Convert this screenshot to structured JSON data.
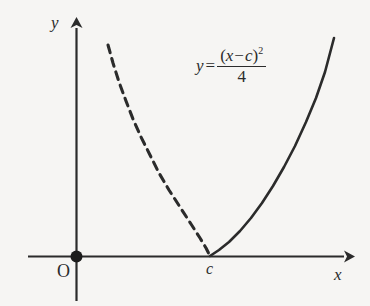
{
  "figure": {
    "background_color": "#f6f5f3",
    "ink_color": "#2b2b2b",
    "axes": {
      "y_axis_label": "y",
      "x_axis_label": "x",
      "origin_label": "O"
    },
    "annotations": {
      "vertex_tick_label": "c"
    },
    "equation": {
      "lhs": "y",
      "equals": "=",
      "numerator_open_paren": "(",
      "numerator_var": "x",
      "numerator_minus": "−",
      "numerator_const": "c",
      "numerator_close_paren": ")",
      "numerator_exponent": "2",
      "denominator": "4",
      "plain_text": "y = (x − c)² / 4"
    }
  },
  "chart_data": {
    "type": "line",
    "title": "",
    "xlabel": "x",
    "ylabel": "y",
    "equation": "y = (x - c)^2 / 4",
    "parameters": {
      "c": 1,
      "coefficient_denominator": 4
    },
    "grid": false,
    "legend": null,
    "axis_style": {
      "x_axis_arrow": true,
      "y_axis_arrow": true,
      "origin_marker": "filled-dot",
      "origin_label": "O",
      "tick_labels_x": [
        "c"
      ],
      "tick_labels_y": []
    },
    "series": [
      {
        "name": "left-branch",
        "linestyle": "dashed",
        "color": "#2b2b2b",
        "description": "Portion of the parabola to the left of the vertex x = c, drawn dashed.",
        "points_px": [
          [
            108,
            45
          ],
          [
            113,
            63
          ],
          [
            119,
            82
          ],
          [
            126,
            101
          ],
          [
            133,
            119
          ],
          [
            141,
            137
          ],
          [
            150,
            155
          ],
          [
            159,
            173
          ],
          [
            169,
            190
          ],
          [
            180,
            207
          ],
          [
            191,
            224
          ],
          [
            200,
            238
          ],
          [
            206,
            248
          ],
          [
            210,
            256
          ]
        ]
      },
      {
        "name": "right-branch",
        "linestyle": "solid",
        "color": "#2b2b2b",
        "description": "Portion of the parabola to the right of the vertex x = c, drawn solid.",
        "points_px": [
          [
            210,
            256
          ],
          [
            219,
            250
          ],
          [
            229,
            242
          ],
          [
            240,
            231
          ],
          [
            251,
            218
          ],
          [
            262,
            203
          ],
          [
            273,
            186
          ],
          [
            284,
            167
          ],
          [
            295,
            146
          ],
          [
            306,
            122
          ],
          [
            316,
            98
          ],
          [
            325,
            72
          ],
          [
            334,
            38
          ]
        ]
      }
    ],
    "annotations": [
      {
        "text": "y = (x - c)^2 / 4",
        "position_px": [
          255,
          72
        ],
        "kind": "equation-label"
      },
      {
        "text": "c",
        "position_px": [
          212,
          272
        ],
        "kind": "x-axis-tick-label"
      },
      {
        "text": "O",
        "position_px": [
          64,
          274
        ],
        "kind": "origin-label"
      }
    ],
    "key_points": [
      {
        "name": "origin",
        "x_px": 76,
        "y_px": 256,
        "marker": "filled-dot"
      },
      {
        "name": "vertex",
        "x_px": 210,
        "y_px": 256,
        "marker": "none",
        "note": "parabola touches x-axis at x = c"
      }
    ]
  }
}
